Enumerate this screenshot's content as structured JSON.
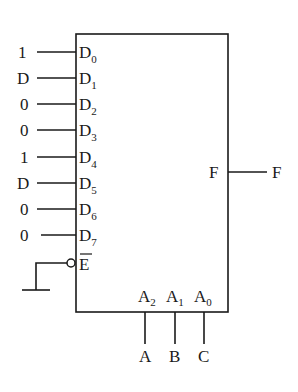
{
  "diagram": {
    "type": "multiplexer-8to1",
    "inputs": [
      {
        "pin": "D",
        "index": "0",
        "value": "1"
      },
      {
        "pin": "D",
        "index": "1",
        "value": "D"
      },
      {
        "pin": "D",
        "index": "2",
        "value": "0"
      },
      {
        "pin": "D",
        "index": "3",
        "value": "0"
      },
      {
        "pin": "D",
        "index": "4",
        "value": "1"
      },
      {
        "pin": "D",
        "index": "5",
        "value": "D"
      },
      {
        "pin": "D",
        "index": "6",
        "value": "0"
      },
      {
        "pin": "D",
        "index": "7",
        "value": "0"
      }
    ],
    "enable": {
      "pin": "E",
      "active_low": true,
      "connection": "ground"
    },
    "output": {
      "pin": "F",
      "signal": "F"
    },
    "selects": [
      {
        "pin": "A",
        "index": "2",
        "signal": "A"
      },
      {
        "pin": "A",
        "index": "1",
        "signal": "B"
      },
      {
        "pin": "A",
        "index": "0",
        "signal": "C"
      }
    ],
    "colors": {
      "line": "#1a1a1a",
      "background": "#ffffff"
    }
  }
}
